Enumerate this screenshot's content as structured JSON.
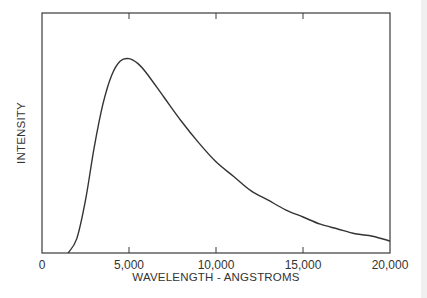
{
  "chart_data": {
    "type": "line",
    "title": "",
    "xlabel": "WAVELENGTH - ANGSTROMS",
    "ylabel": "INTENSITY",
    "xlim": [
      0,
      20000
    ],
    "ylim": [
      0,
      1
    ],
    "grid": false,
    "legend": null,
    "x_ticks": [
      0,
      5000,
      10000,
      15000,
      20000
    ],
    "x_tick_labels": [
      "0",
      "5,000",
      "10,000",
      "15,000",
      "20,000"
    ],
    "y_ticks": [],
    "series": [
      {
        "name": "Blackbody spectrum",
        "x": [
          1500,
          2000,
          2500,
          3000,
          3500,
          4000,
          4500,
          5000,
          5500,
          6000,
          7000,
          8000,
          9000,
          10000,
          11000,
          12000,
          13000,
          14000,
          15000,
          16000,
          17000,
          18000,
          19000,
          20000
        ],
        "values": [
          0.0,
          0.06,
          0.22,
          0.44,
          0.62,
          0.74,
          0.8,
          0.81,
          0.79,
          0.75,
          0.65,
          0.55,
          0.46,
          0.38,
          0.32,
          0.26,
          0.22,
          0.18,
          0.15,
          0.12,
          0.1,
          0.08,
          0.07,
          0.05
        ]
      }
    ]
  },
  "axes": {
    "x_label": "WAVELENGTH - ANGSTROMS",
    "y_label": "INTENSITY",
    "x_tick_labels": [
      "0",
      "5,000",
      "10,000",
      "15,000",
      "20,000"
    ]
  }
}
